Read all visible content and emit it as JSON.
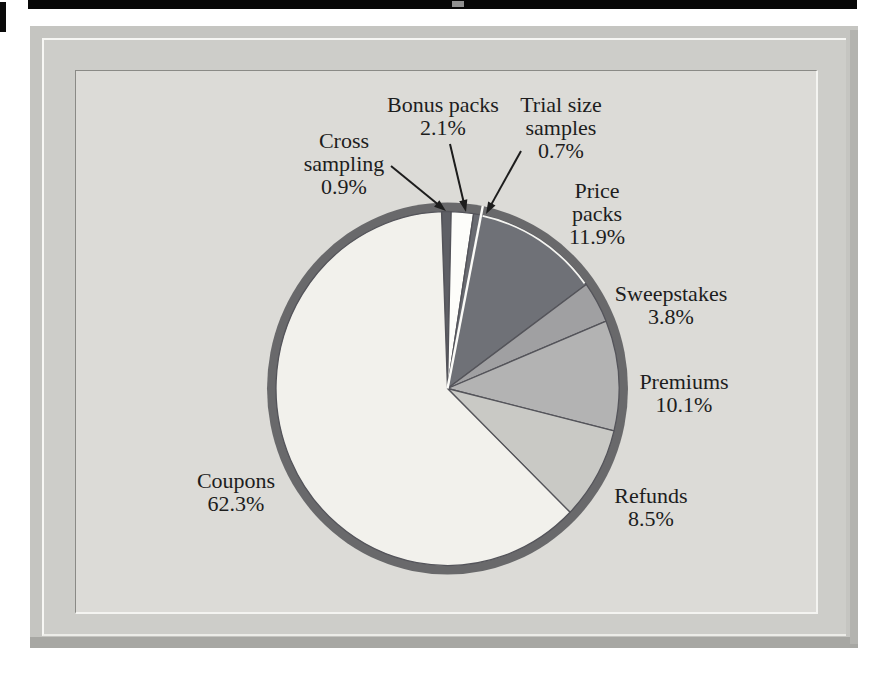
{
  "figure": {
    "description_region": "scanned pie chart panel",
    "panel_background": "#dcdbd7",
    "text_color": "#1d1d1d"
  },
  "chart_data": {
    "type": "pie",
    "title": "",
    "start_angle_deg": -2,
    "direction": "clockwise",
    "legend_position": "none",
    "ring_color": "#69696b",
    "slice_border_color": "#54545a",
    "slices": [
      {
        "id": "cross-sampling",
        "label": "Cross sampling",
        "value": 0.9,
        "pct_text": "0.9%",
        "color": "#5e5f65",
        "callout": "Cross\nsampling\n0.9%"
      },
      {
        "id": "bonus-packs",
        "label": "Bonus packs",
        "value": 2.1,
        "pct_text": "2.1%",
        "color": "#fdfdfa",
        "callout": "Bonus packs\n2.1%"
      },
      {
        "id": "trial-size-samples",
        "label": "Trial size samples",
        "value": 0.7,
        "pct_text": "0.7%",
        "color": "#696b71",
        "callout": "Trial size\nsamples\n0.7%"
      },
      {
        "id": "price-packs",
        "label": "Price packs",
        "value": 11.9,
        "pct_text": "11.9%",
        "color": "#6f7177",
        "callout": "Price\npacks\n11.9%",
        "white_start_edge": true,
        "white_outer_arc": true
      },
      {
        "id": "sweepstakes",
        "label": "Sweepstakes",
        "value": 3.8,
        "pct_text": "3.8%",
        "color": "#a0a0a2",
        "callout": "Sweepstakes\n3.8%"
      },
      {
        "id": "premiums",
        "label": "Premiums",
        "value": 10.1,
        "pct_text": "10.1%",
        "color": "#b3b3b3",
        "callout": "Premiums\n10.1%"
      },
      {
        "id": "refunds",
        "label": "Refunds",
        "value": 8.5,
        "pct_text": "8.5%",
        "color": "#c9c9c5",
        "callout": "Refunds\n8.5%"
      },
      {
        "id": "coupons",
        "label": "Coupons",
        "value": 62.3,
        "pct_text": "62.3%",
        "color": "#f2f1ec",
        "callout": "Coupons\n62.3%"
      }
    ]
  }
}
